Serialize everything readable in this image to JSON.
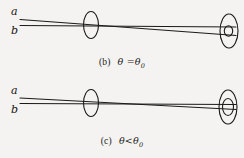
{
  "figure": {
    "background_color": "#f4f3f1",
    "ink_color": "#1a1a1a",
    "panels": [
      {
        "id": "b",
        "caption_tag": "(b)",
        "caption_expression": "θ =θ",
        "caption_subscript": "0",
        "caption_full": "(b)  θ =θ0",
        "ray_label_top": "a",
        "ray_label_bottom": "b",
        "lens_count": 2,
        "description": "two rays crossing at the first aperture and diverging toward the second aperture"
      },
      {
        "id": "c",
        "caption_tag": "(c)",
        "caption_expression": "θ<θ",
        "caption_subscript": "0",
        "caption_full": "(c)  θ<θ0",
        "ray_label_top": "a",
        "ray_label_bottom": "b",
        "lens_count": 2,
        "description": "two rays converging near the first aperture and slightly diverging toward the second aperture"
      }
    ]
  }
}
